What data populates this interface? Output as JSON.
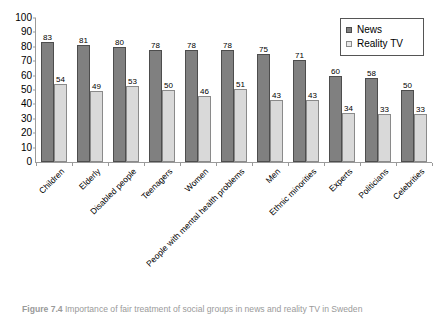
{
  "figure": {
    "caption_label": "Figure 7.4",
    "caption_text": "Importance of fair treatment of social groups in news and reality TV in Sweden",
    "clipped_top_text": ""
  },
  "legend": {
    "position": "top-right",
    "entries": [
      {
        "label": "News",
        "color": "#808080"
      },
      {
        "label": "Reality TV",
        "color": "#e9e9e9"
      }
    ]
  },
  "axis": {
    "y_ticks": [
      "100",
      "90",
      "80",
      "70",
      "60",
      "50",
      "40",
      "30",
      "20",
      "10",
      "0"
    ]
  },
  "chart_data": {
    "type": "bar",
    "title": "",
    "xlabel": "",
    "ylabel": "",
    "ylim": [
      0,
      100
    ],
    "ytick_step": 10,
    "grid": false,
    "legend_position": "top-right",
    "categories": [
      "Children",
      "Elderly",
      "Disabled people",
      "Teenagers",
      "Women",
      "People with mental health problems",
      "Men",
      "Ethnic minorities",
      "Experts",
      "Politicians",
      "Celebrities"
    ],
    "series": [
      {
        "name": "News",
        "color": "#808080",
        "values": [
          83,
          81,
          80,
          78,
          78,
          78,
          75,
          71,
          60,
          58,
          50
        ]
      },
      {
        "name": "Reality TV",
        "color": "#d9d9d9",
        "values": [
          54,
          49,
          53,
          50,
          46,
          51,
          43,
          43,
          34,
          33,
          33
        ]
      }
    ]
  }
}
